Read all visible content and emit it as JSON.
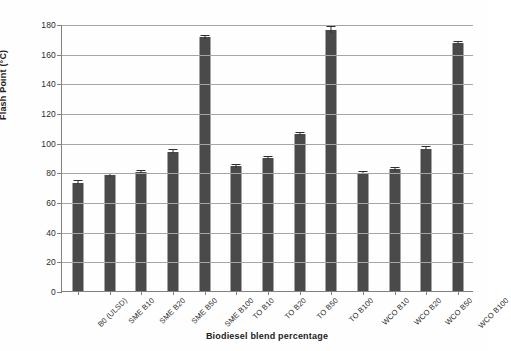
{
  "chart_data": {
    "type": "bar",
    "title": "",
    "xlabel": "Biodiesel blend percentage",
    "ylabel": "Flash Point (°C)",
    "ylim": [
      0,
      180
    ],
    "ytick_step": 20,
    "yticks": [
      0,
      20,
      40,
      60,
      80,
      100,
      120,
      140,
      160,
      180
    ],
    "grid": "horizontal",
    "legend": "none",
    "bar_color": "#4a4a4a",
    "categories": [
      "B0 (ULSD)",
      "SME B10",
      "SME B20",
      "SME B50",
      "SME B100",
      "TO B10",
      "TO B20",
      "TO B50",
      "TO B100",
      "WCO B10",
      "WCO B20",
      "WCO B50",
      "WCO B100"
    ],
    "values": [
      73,
      78,
      80,
      94,
      171,
      84,
      89.5,
      106,
      176,
      79.5,
      82,
      96,
      167
    ],
    "errors": [
      1.0,
      1.2,
      1.2,
      0.8,
      0.8,
      0.8,
      0.8,
      0.8,
      2.0,
      0.8,
      0.8,
      0.8,
      0.8
    ]
  },
  "axis": {
    "y_title": "Flash Point (°C)",
    "x_title": "Biodiesel blend percentage",
    "ytick_labels": [
      "180",
      "160",
      "140",
      "120",
      "100",
      "80",
      "60",
      "40",
      "20",
      "0"
    ]
  }
}
